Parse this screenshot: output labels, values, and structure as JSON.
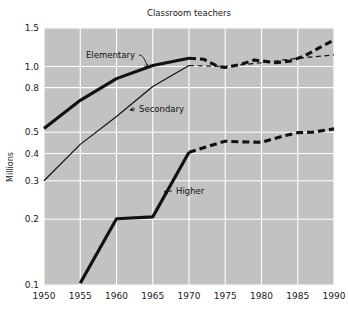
{
  "chart_data": {
    "type": "line",
    "title": "Classroom teachers",
    "xlabel": "",
    "ylabel": "Millions",
    "yscale": "log",
    "ylim": [
      0.1,
      1.5
    ],
    "xlim": [
      1950,
      1990
    ],
    "grid": true,
    "legend_position": "inline-annotations",
    "xticks": [
      "1950",
      "1955",
      "1960",
      "1965",
      "1970",
      "1975",
      "1980",
      "1985",
      "1990"
    ],
    "xtick_values": [
      1950,
      1955,
      1960,
      1965,
      1970,
      1975,
      1980,
      1985,
      1990
    ],
    "yticks": [
      "1.5",
      "1.0",
      "0.8",
      "0.5",
      "0.4",
      "0.3",
      "0.2",
      "0.1"
    ],
    "ytick_values": [
      1.5,
      1.0,
      0.8,
      0.5,
      0.4,
      0.3,
      0.2,
      0.1
    ],
    "background": "#c2c2c2",
    "gridcolor": "#ffffff",
    "linecolor": "#111111",
    "series": [
      {
        "name": "Elementary",
        "style": "thick",
        "solid": {
          "x": [
            1950,
            1955,
            1960,
            1965,
            1970
          ],
          "y": [
            0.52,
            0.7,
            0.88,
            1.01,
            1.09
          ]
        },
        "dashed": {
          "x": [
            1970,
            1972,
            1974,
            1975,
            1977,
            1979,
            1980,
            1982,
            1984,
            1986,
            1988,
            1990
          ],
          "y": [
            1.09,
            1.08,
            1.0,
            0.99,
            1.02,
            1.07,
            1.06,
            1.04,
            1.06,
            1.12,
            1.22,
            1.32
          ]
        }
      },
      {
        "name": "Secondary",
        "style": "thin",
        "solid": {
          "x": [
            1950,
            1955,
            1960,
            1965,
            1970
          ],
          "y": [
            0.3,
            0.44,
            0.59,
            0.81,
            1.01
          ]
        },
        "dashed": {
          "x": [
            1970,
            1975,
            1980,
            1985,
            1990
          ],
          "y": [
            1.01,
            1.0,
            1.04,
            1.09,
            1.13
          ]
        }
      },
      {
        "name": "Higher",
        "style": "thick",
        "solid": {
          "x": [
            1955,
            1960,
            1965,
            1970
          ],
          "y": [
            0.102,
            0.201,
            0.205,
            0.405
          ]
        },
        "dashed": {
          "x": [
            1970,
            1972,
            1975,
            1977,
            1980,
            1983,
            1985,
            1987,
            1990
          ],
          "y": [
            0.405,
            0.425,
            0.455,
            0.452,
            0.45,
            0.48,
            0.498,
            0.5,
            0.518
          ]
        }
      }
    ],
    "annotations": [
      {
        "label": "Elementary",
        "text_x": 86,
        "text_y": 58,
        "target_x": 148,
        "target_y": 68
      },
      {
        "label": "Secondary",
        "text_x": 139,
        "text_y": 112,
        "target_x": 130,
        "target_y": 110
      },
      {
        "label": "Higher",
        "text_x": 176,
        "text_y": 194,
        "target_x": 164,
        "target_y": 192
      }
    ]
  }
}
